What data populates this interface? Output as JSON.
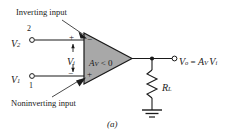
{
  "figure": {
    "caption": "(a)",
    "background_color": "#ffffff",
    "line_color": "#1a1a1a",
    "amplifier_fill": "#a8a8a8"
  },
  "annotations": {
    "inverting_label": "Inverting input",
    "noninverting_label": "Noninverting input"
  },
  "inputs": {
    "top": {
      "signal": "V",
      "signal_sub": "2",
      "terminal_number": "2",
      "polarity": "+"
    },
    "bottom": {
      "signal": "V",
      "signal_sub": "1",
      "terminal_number": "1",
      "polarity": "−"
    },
    "differential": {
      "symbol": "V",
      "symbol_sub": "i"
    }
  },
  "amplifier": {
    "gain_text": "A",
    "gain_sub": "V",
    "gain_relation": "< 0",
    "inverting_terminal": "−",
    "noninverting_terminal": "+"
  },
  "output": {
    "symbol": "V",
    "symbol_sub": "o",
    "equals": "=",
    "expression_gain": "A",
    "expression_gain_sub": "V",
    "expression_input": "V",
    "expression_input_sub": "i"
  },
  "load": {
    "label": "R",
    "label_sub": "L"
  }
}
